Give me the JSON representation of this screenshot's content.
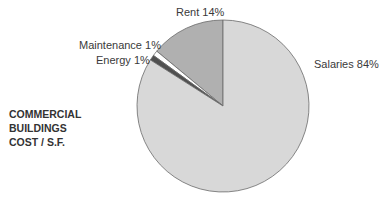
{
  "chart_data": {
    "type": "pie",
    "title": [
      "COMMERCIAL",
      "BUILDINGS",
      "COST / S.F."
    ],
    "slices": [
      {
        "label": "Rent",
        "value": 14,
        "display": "Rent 14%",
        "color": "#b0b0b0"
      },
      {
        "label": "Maintenance",
        "value": 1,
        "display": "Maintenance 1%",
        "color": "#ffffff"
      },
      {
        "label": "Energy",
        "value": 1,
        "display": "Energy 1%",
        "color": "#505050"
      },
      {
        "label": "Salaries",
        "value": 84,
        "display": "Salaries 84%",
        "color": "#d8d8d8"
      }
    ],
    "start_angle": "12 o'clock",
    "direction": "counterclockwise",
    "legend": "none (direct labels)"
  }
}
